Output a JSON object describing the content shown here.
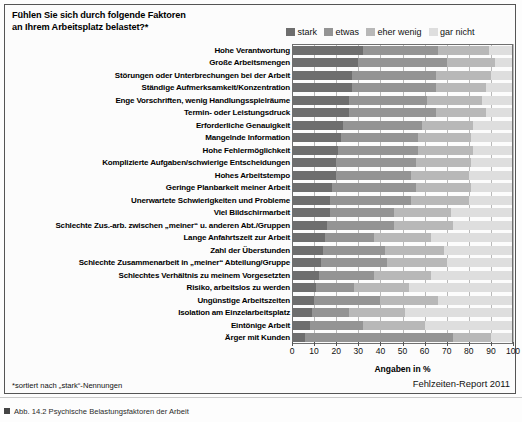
{
  "figure": {
    "title_line1": "Fühlen Sie sich durch folgende Faktoren",
    "title_line2": "an Ihrem Arbeitsplatz belastet?*",
    "footnote": "*sortiert nach „stark“-Nennungen",
    "source": "Fehlzeiten-Report 2011",
    "caption": "Abb. 14.2 Psychische Belastungsfaktoren der Arbeit"
  },
  "colors": {
    "stark": "#6e6e6e",
    "etwas": "#949494",
    "eher_wenig": "#b8b8b8",
    "gar_nicht": "#dedede",
    "gridline": "#b9b9b9",
    "axis": "#6f6f6f"
  },
  "chart_data": {
    "type": "bar",
    "orientation": "horizontal",
    "stacked": true,
    "stack_mode": "percent",
    "title": "Fühlen Sie sich durch folgende Faktoren an Ihrem Arbeitsplatz belastet?*",
    "xlabel": "Angaben in %",
    "ylabel": "",
    "xlim": [
      0,
      100
    ],
    "xticks": [
      0,
      10,
      20,
      30,
      40,
      50,
      60,
      70,
      80,
      90,
      100
    ],
    "grid": true,
    "legend_position": "top-right",
    "legend": [
      "stark",
      "etwas",
      "eher wenig",
      "gar nicht"
    ],
    "categories": [
      "Hohe Verantwortung",
      "Große Arbeitsmengen",
      "Störungen oder Unterbrechungen bei der Arbeit",
      "Ständige Aufmerksamkeit/Konzentration",
      "Enge Vorschriften, wenig Handlungsspielräume",
      "Termin- oder Leistungsdruck",
      "Erforderliche Genauigkeit",
      "Mangelnde Information",
      "Hohe Fehlermöglichkeit",
      "Komplizierte Aufgaben/schwierige Entscheidungen",
      "Hohes Arbeitstempo",
      "Geringe Planbarkeit meiner Arbeit",
      "Unerwartete Schwierigkeiten und Probleme",
      "Viel Bildschirmarbeit",
      "Schlechte Zus.-arb. zwischen „meiner“ u. anderen Abt./Gruppen",
      "Lange Anfahrtszeit zur Arbeit",
      "Zahl der Überstunden",
      "Schlechte Zusammenarbeit in „meiner“ Abteilung/Gruppe",
      "Schlechtes Verhältnis zu meinem Vorgesetzten",
      "Risiko, arbeitslos zu werden",
      "Ungünstige Arbeitszeiten",
      "Isolation am Einzelarbeitsplatz",
      "Eintönige Arbeit",
      "Ärger mit Kunden"
    ],
    "series": [
      {
        "name": "stark",
        "values": [
          32,
          30,
          27,
          27,
          26,
          26,
          23,
          22,
          21,
          20,
          20,
          18,
          17,
          17,
          16,
          15,
          14,
          13,
          12,
          11,
          10,
          9,
          8,
          6
        ]
      },
      {
        "name": "etwas",
        "values": [
          34,
          40,
          38,
          38,
          35,
          39,
          36,
          35,
          36,
          36,
          34,
          38,
          37,
          29,
          30,
          22,
          28,
          30,
          25,
          17,
          30,
          17,
          24,
          67
        ]
      },
      {
        "name": "eher wenig",
        "values": [
          23,
          22,
          25,
          23,
          25,
          23,
          23,
          24,
          25,
          25,
          26,
          25,
          26,
          26,
          27,
          26,
          27,
          27,
          26,
          25,
          26,
          25,
          28,
          17
        ]
      },
      {
        "name": "gar nicht",
        "values": [
          11,
          8,
          10,
          12,
          14,
          12,
          18,
          19,
          18,
          19,
          20,
          19,
          20,
          28,
          27,
          37,
          31,
          30,
          37,
          47,
          34,
          49,
          40,
          10
        ]
      }
    ]
  }
}
